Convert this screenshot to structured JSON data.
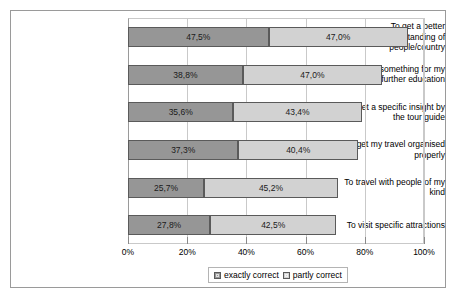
{
  "chart_data": {
    "type": "bar",
    "orientation": "horizontal",
    "stacked": true,
    "title": "",
    "xlabel": "",
    "ylabel": "",
    "xlim": [
      0,
      100
    ],
    "xticks": [
      "0%",
      "20%",
      "40%",
      "60%",
      "80%",
      "100%"
    ],
    "xtick_values": [
      0,
      20,
      40,
      60,
      80,
      100
    ],
    "grid": true,
    "legend_position": "bottom",
    "categories": [
      "To get a better understanding of people/country",
      "To do something for my further education",
      "To get a specific insight by the tour guide",
      "To get my travel organised properly",
      "To travel with people of my kind",
      "To visit specific attractions"
    ],
    "category_lines": [
      [
        "To get a better",
        "understanding of",
        "people/country"
      ],
      [
        "To do something for my",
        "further education"
      ],
      [
        "To get a specific insight by",
        "the tour guide"
      ],
      [
        "To get my travel organised",
        "properly"
      ],
      [
        "To travel with people of my",
        "kind"
      ],
      [
        "To visit specific attractions"
      ]
    ],
    "series": [
      {
        "name": "exactly correct",
        "color": "#969696",
        "values": [
          47.5,
          38.8,
          35.6,
          37.3,
          25.7,
          27.8
        ],
        "labels": [
          "47,5%",
          "38,8%",
          "35,6%",
          "37,3%",
          "25,7%",
          "27,8%"
        ]
      },
      {
        "name": "partly correct",
        "color": "#d2d2d2",
        "values": [
          47.0,
          47.0,
          43.4,
          40.4,
          45.2,
          42.5
        ],
        "labels": [
          "47,0%",
          "47,0%",
          "43,4%",
          "40,4%",
          "45,2%",
          "42,5%"
        ]
      }
    ]
  },
  "legend": {
    "items": [
      {
        "label": "exactly correct",
        "icon": "legend-swatch-icon"
      },
      {
        "label": "partly correct",
        "icon": "legend-swatch-icon"
      }
    ]
  }
}
